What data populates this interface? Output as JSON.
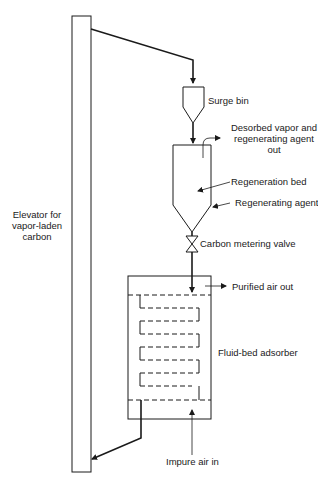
{
  "diagram": {
    "type": "process-flow",
    "labels": {
      "surge_bin": "Surge bin",
      "desorbed_line1": "Desorbed vapor and",
      "desorbed_line2": "regenerating agent",
      "desorbed_line3": "out",
      "regeneration_bed": "Regeneration bed",
      "regenerating_agent": "Regenerating agent",
      "carbon_metering_valve": "Carbon metering valve",
      "purified_air_out": "Purified air out",
      "fluid_bed_adsorber": "Fluid-bed adsorber",
      "impure_air_in": "Impure air in",
      "elevator_line1": "Elevator for",
      "elevator_line2": "vapor-laden",
      "elevator_line3": "carbon"
    },
    "colors": {
      "line": "#1a1a1a",
      "background": "#ffffff"
    }
  }
}
